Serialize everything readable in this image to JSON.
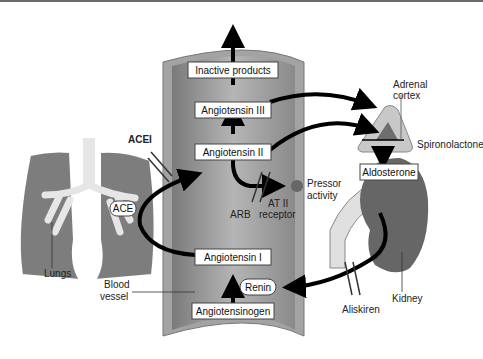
{
  "diagram": {
    "vessel_boxes": {
      "inactive": "Inactive products",
      "ang3": "Angiotensin III",
      "ang2": "Angiotensin II",
      "ang1": "Angiotensin I",
      "angiotensinogen": "Angiotensinogen",
      "renin": "Renin"
    },
    "labels": {
      "acei": "ACEI",
      "ace": "ACE",
      "lungs": "Lungs",
      "blood_vessel_1": "Blood",
      "blood_vessel_2": "vessel",
      "arb": "ARB",
      "at2_1": "AT II",
      "at2_2": "receptor",
      "pressor_1": "Pressor",
      "pressor_2": "activity",
      "adrenal_1": "Adrenal",
      "adrenal_2": "cortex",
      "spironolactone": "Spironolactone",
      "aldosterone": "Aldosterone",
      "kidney": "Kidney",
      "aliskiren": "Aliskiren"
    },
    "colors": {
      "vessel_wall": "#a9a9a9",
      "vessel_inner": "#8c8c8c",
      "lung_tissue": "#7d7d7d",
      "airway": "#e6e6e6",
      "kidney": "#666666",
      "adrenal_outer": "#c8c8c8",
      "adrenal_inner": "#6e6e6e",
      "arrow": "#000000"
    }
  }
}
